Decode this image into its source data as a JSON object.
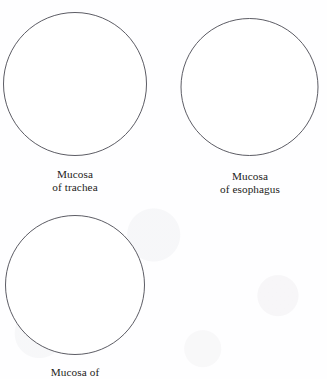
{
  "figure": {
    "name": "mucosa-specimen-diagram",
    "background_color": "#fefeff",
    "stroke_color": "#4a4a52",
    "text_color": "#1c1c20",
    "width": 327,
    "height": 379
  },
  "panels": [
    {
      "id": "trachea",
      "circle": {
        "cx": 75,
        "cy": 84,
        "r": 71.5
      },
      "caption_lines": [
        "Mucosa",
        "of trachea"
      ],
      "caption_top": 168,
      "caption_left": 15,
      "caption_width": 120
    },
    {
      "id": "esophagus",
      "circle": {
        "cx": 249.5,
        "cy": 87,
        "r": 68.5
      },
      "caption_lines": [
        "Mucosa",
        "of esophagus"
      ],
      "caption_top": 170,
      "caption_left": 188,
      "caption_width": 124
    },
    {
      "id": "third-specimen",
      "circle": {
        "cx": 75,
        "cy": 285,
        "r": 69.5
      },
      "caption_lines": [
        "Mucosa of"
      ],
      "caption_top": 366,
      "caption_left": 15,
      "caption_width": 120
    }
  ]
}
